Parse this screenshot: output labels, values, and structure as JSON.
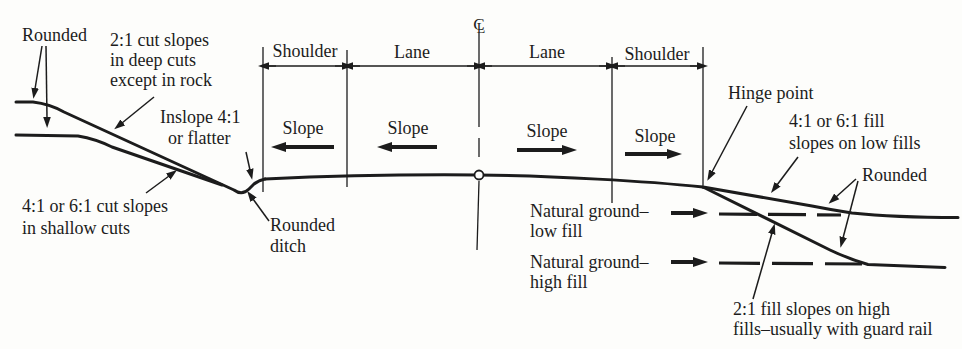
{
  "figure": {
    "type": "highway-cross-section-diagram",
    "colors": {
      "ink": "#1c1c1c",
      "paper": "#fdfdfb"
    },
    "dimensions": {
      "shoulder_left": "Shoulder",
      "lane_left": "Lane",
      "lane_right": "Lane",
      "shoulder_right": "Shoulder"
    },
    "centerline_symbol": {
      "c": "C",
      "l": "L"
    },
    "slope_label": "Slope",
    "annotations": {
      "rounded_left": "Rounded",
      "cut_deep": [
        "2:1 cut slopes",
        "in deep cuts",
        "except in rock"
      ],
      "inslope": [
        "Inslope 4:1",
        "or flatter"
      ],
      "cut_shallow": [
        "4:1 or 6:1 cut slopes",
        "in shallow cuts"
      ],
      "rounded_ditch": [
        "Rounded",
        "ditch"
      ],
      "hinge_point": "Hinge point",
      "fill_low": [
        "4:1 or 6:1 fill",
        "slopes on low fills"
      ],
      "rounded_right": "Rounded",
      "natural_ground_low": [
        "Natural ground–",
        "low fill"
      ],
      "natural_ground_high": [
        "Natural ground–",
        "high fill"
      ],
      "fill_high": [
        "2:1 fill slopes on high",
        "fills–usually with guard rail"
      ]
    }
  }
}
